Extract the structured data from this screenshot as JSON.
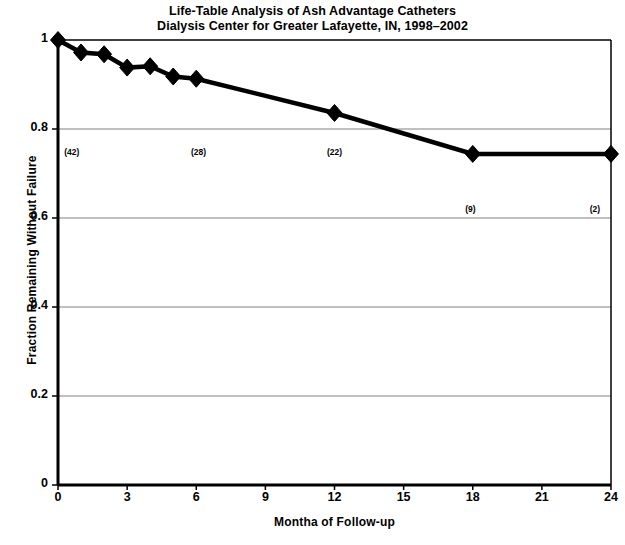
{
  "chart_data": {
    "type": "line",
    "title": "Life-Table Analysis of Ash Advantage Catheters",
    "subtitle": "Dialysis Center for Greater Lafayette, IN, 1998–2002",
    "xlabel": "Montha of Follow-up",
    "ylabel": "Fraction Remaining Without Failure",
    "xlim": [
      0,
      24
    ],
    "ylim": [
      0,
      1
    ],
    "xticks": [
      0,
      3,
      6,
      9,
      12,
      15,
      18,
      21,
      24
    ],
    "xtick_labels": [
      "0",
      "3",
      "6",
      "9",
      "12",
      "15",
      "18",
      "21",
      "24"
    ],
    "yticks": [
      0,
      0.2,
      0.4,
      0.6,
      0.8,
      1
    ],
    "ytick_labels": [
      "0",
      "0.2",
      "0.4",
      "0.6",
      "0.8",
      "1"
    ],
    "grid": "horizontal",
    "legend": null,
    "series": [
      {
        "name": "Fraction remaining without failure",
        "marker": "diamond",
        "color": "#000000",
        "x": [
          0,
          1,
          2,
          3,
          4,
          5,
          6,
          12,
          18,
          24
        ],
        "y": [
          1.0,
          0.972,
          0.968,
          0.938,
          0.941,
          0.918,
          0.913,
          0.836,
          0.744,
          0.744
        ]
      }
    ],
    "annotations": [
      {
        "text": "(42)",
        "x": 0.6,
        "y": 0.745
      },
      {
        "text": "(28)",
        "x": 6.1,
        "y": 0.745
      },
      {
        "text": "(22)",
        "x": 12.0,
        "y": 0.745
      },
      {
        "text": "(9)",
        "x": 17.9,
        "y": 0.617
      },
      {
        "text": "(2)",
        "x": 23.3,
        "y": 0.617
      }
    ]
  }
}
